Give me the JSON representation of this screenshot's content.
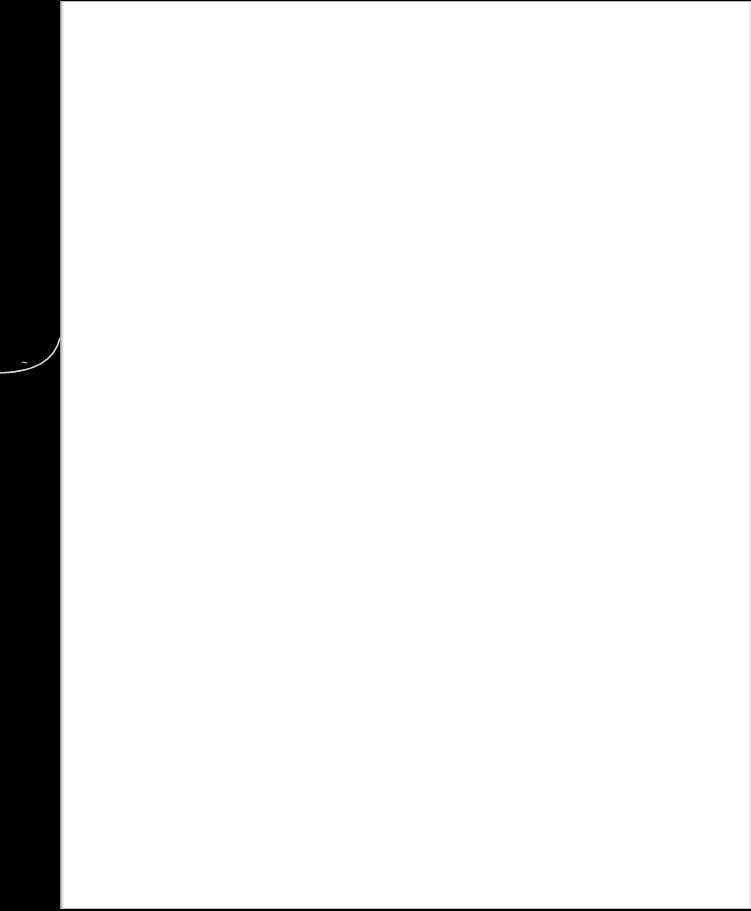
{
  "document": {
    "type": "scanned-page",
    "content": "",
    "page_color": "#ffffff",
    "background_color": "#000000"
  }
}
